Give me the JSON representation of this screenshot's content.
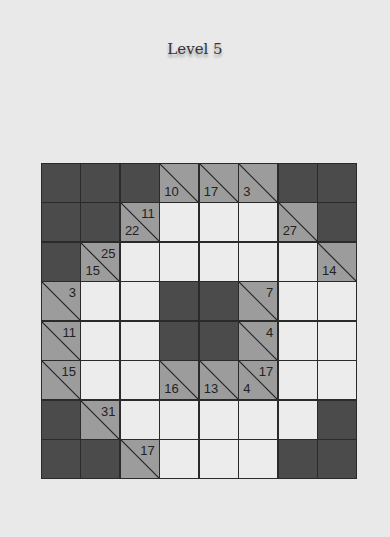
{
  "title": "Level 5",
  "colors": {
    "background": "#e9e9e9",
    "blocked": "#4b4b4b",
    "clue": "#9c9c9c",
    "empty": "#ececec",
    "lines": "#2a2a2a"
  },
  "grid": {
    "rows": 8,
    "cols": 8,
    "cells": [
      [
        {
          "t": "D"
        },
        {
          "t": "D"
        },
        {
          "t": "D"
        },
        {
          "t": "C",
          "down": "10"
        },
        {
          "t": "C",
          "down": "17"
        },
        {
          "t": "C",
          "down": "3"
        },
        {
          "t": "D"
        },
        {
          "t": "D"
        }
      ],
      [
        {
          "t": "D"
        },
        {
          "t": "D"
        },
        {
          "t": "C",
          "right": "11",
          "down": "22"
        },
        {
          "t": "W"
        },
        {
          "t": "W"
        },
        {
          "t": "W"
        },
        {
          "t": "C",
          "down": "27"
        },
        {
          "t": "D"
        }
      ],
      [
        {
          "t": "D"
        },
        {
          "t": "C",
          "right": "25",
          "down": "15"
        },
        {
          "t": "W"
        },
        {
          "t": "W"
        },
        {
          "t": "W"
        },
        {
          "t": "W"
        },
        {
          "t": "W"
        },
        {
          "t": "C",
          "down": "14"
        }
      ],
      [
        {
          "t": "C",
          "right": "3"
        },
        {
          "t": "W"
        },
        {
          "t": "W"
        },
        {
          "t": "D"
        },
        {
          "t": "D"
        },
        {
          "t": "C",
          "right": "7"
        },
        {
          "t": "W"
        },
        {
          "t": "W"
        }
      ],
      [
        {
          "t": "C",
          "right": "11"
        },
        {
          "t": "W"
        },
        {
          "t": "W"
        },
        {
          "t": "D"
        },
        {
          "t": "D"
        },
        {
          "t": "C",
          "right": "4"
        },
        {
          "t": "W"
        },
        {
          "t": "W"
        }
      ],
      [
        {
          "t": "C",
          "right": "15"
        },
        {
          "t": "W"
        },
        {
          "t": "W"
        },
        {
          "t": "C",
          "down": "16"
        },
        {
          "t": "C",
          "down": "13"
        },
        {
          "t": "C",
          "right": "17",
          "down": "4"
        },
        {
          "t": "W"
        },
        {
          "t": "W"
        }
      ],
      [
        {
          "t": "D"
        },
        {
          "t": "C",
          "right": "31"
        },
        {
          "t": "W"
        },
        {
          "t": "W"
        },
        {
          "t": "W"
        },
        {
          "t": "W"
        },
        {
          "t": "W"
        },
        {
          "t": "D"
        }
      ],
      [
        {
          "t": "D"
        },
        {
          "t": "D"
        },
        {
          "t": "C",
          "right": "17"
        },
        {
          "t": "W"
        },
        {
          "t": "W"
        },
        {
          "t": "W"
        },
        {
          "t": "D"
        },
        {
          "t": "D"
        }
      ]
    ]
  }
}
